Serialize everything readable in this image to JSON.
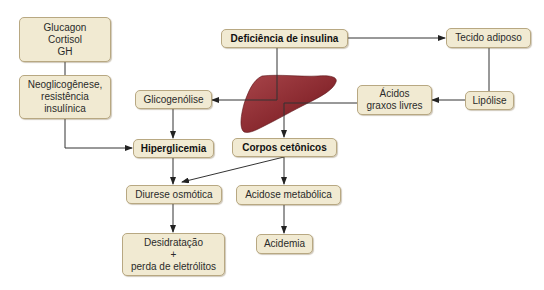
{
  "diagram": {
    "colors": {
      "node_fill": "#f1ead2",
      "node_border": "#b8a882",
      "edge": "#333333",
      "liver": "#8e2a30"
    },
    "nodes": {
      "hormones": {
        "lines": [
          "Glucagon",
          "Cortisol",
          "GH"
        ]
      },
      "neoglicogenese": {
        "lines": [
          "Neoglicogênese,",
          "resistência",
          "insulínica"
        ]
      },
      "glicogenolise": {
        "label": "Glicogenólise"
      },
      "hiperglicemia": {
        "label": "Hiperglicemia"
      },
      "deficiencia": {
        "label": "Deficiência de insulina"
      },
      "tecido_adiposo": {
        "label": "Tecido adiposo"
      },
      "acidos_graxos": {
        "lines": [
          "Ácidos",
          "graxos livres"
        ]
      },
      "lipolise": {
        "label": "Lipólise"
      },
      "corpos_cetonicos": {
        "label": "Corpos cetônicos"
      },
      "diurese": {
        "label": "Diurese osmótica"
      },
      "acidose": {
        "label": "Acidose metabólica"
      },
      "desidratacao": {
        "lines": [
          "Desidratação",
          "+",
          "perda de eletrólitos"
        ]
      },
      "acidemia": {
        "label": "Acidemia"
      }
    },
    "edges": [
      {
        "from": "Glucagon/Cortisol/GH",
        "to": "Neoglicogênese, resistência insulínica"
      },
      {
        "from": "Neoglicogênese, resistência insulínica",
        "to": "Hiperglicemia"
      },
      {
        "from": "Deficiência de insulina",
        "to": "Glicogenólise"
      },
      {
        "from": "Deficiência de insulina",
        "to": "Tecido adiposo"
      },
      {
        "from": "Tecido adiposo",
        "to": "Lipólise"
      },
      {
        "from": "Lipólise",
        "to": "Ácidos graxos livres"
      },
      {
        "from": "Ácidos graxos livres",
        "to": "Corpos cetônicos"
      },
      {
        "from": "Glicogenólise",
        "to": "Hiperglicemia"
      },
      {
        "from": "Hiperglicemia",
        "to": "Diurese osmótica"
      },
      {
        "from": "Corpos cetônicos",
        "to": "Diurese osmótica"
      },
      {
        "from": "Corpos cetônicos",
        "to": "Acidose metabólica"
      },
      {
        "from": "Diurese osmótica",
        "to": "Desidratação + perda de eletrólitos"
      },
      {
        "from": "Acidose metabólica",
        "to": "Acidemia"
      }
    ],
    "image": {
      "liver": "liver-illustration"
    }
  }
}
